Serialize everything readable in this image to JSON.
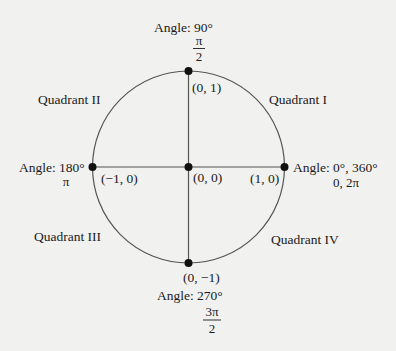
{
  "diagram": {
    "colors": {
      "background": "#f1f1f0",
      "stroke": "#555555",
      "ink": "#1a1a1a"
    },
    "circle": {
      "cx": 188.5,
      "cy": 167,
      "r": 96
    },
    "points": [
      {
        "id": "origin",
        "coords": "(0, 0)"
      },
      {
        "id": "top",
        "coords": "(0, 1)",
        "angle_label": "Angle: 90°",
        "radian_num": "π",
        "radian_den": "2"
      },
      {
        "id": "left",
        "coords": "(−1, 0)",
        "angle_label": "Angle: 180°",
        "radian": "π"
      },
      {
        "id": "right",
        "coords": "(1, 0)",
        "angle_label": "Angle: 0°, 360°",
        "radian": "0, 2π"
      },
      {
        "id": "bottom",
        "coords": "(0, −1)",
        "angle_label": "Angle: 270°",
        "radian_num": "3π",
        "radian_den": "2"
      }
    ],
    "quadrants": [
      {
        "name": "Quadrant I"
      },
      {
        "name": "Quadrant II"
      },
      {
        "name": "Quadrant III"
      },
      {
        "name": "Quadrant IV"
      }
    ]
  }
}
